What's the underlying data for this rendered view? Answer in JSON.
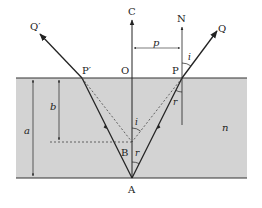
{
  "diagram": {
    "colors": {
      "medium": "#d3d3d3",
      "line": "#222222",
      "background": "#ffffff"
    },
    "points": {
      "Q_prime": "Q′",
      "P_prime": "P′",
      "C": "C",
      "O": "O",
      "N": "N",
      "P": "P",
      "Q": "Q",
      "B": "B",
      "A": "A"
    },
    "lengths": {
      "p": "p",
      "a": "a",
      "b": "b"
    },
    "angles": {
      "i_top": "i",
      "r_right": "r",
      "i_center": "i",
      "r_center": "r"
    },
    "medium_label": "n"
  }
}
